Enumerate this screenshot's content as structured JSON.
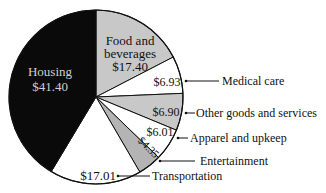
{
  "chart_data": {
    "type": "pie",
    "title": "",
    "unit": "$",
    "start_angle_deg": 0,
    "direction": "clockwise",
    "slices": [
      {
        "label": "Food and beverages",
        "value": 17.4,
        "value_label": "$17.40",
        "color": "#c8c8c8"
      },
      {
        "label": "Medical care",
        "value": 6.93,
        "value_label": "$6.93",
        "color": "#ffffff"
      },
      {
        "label": "Other goods and services",
        "value": 6.9,
        "value_label": "$6.90",
        "color": "#c8c8c8"
      },
      {
        "label": "Apparel and upkeep",
        "value": 6.01,
        "value_label": "$6.01",
        "color": "#ffffff"
      },
      {
        "label": "Entertainment",
        "value": 4.35,
        "value_label": "$4.35",
        "color": "#b4b4b4"
      },
      {
        "label": "Transportation",
        "value": 17.01,
        "value_label": "$17.01",
        "color": "#ffffff"
      },
      {
        "label": "Housing",
        "value": 41.4,
        "value_label": "$41.40",
        "color": "#0a0a0a"
      }
    ],
    "total": 100.0
  },
  "labels": {
    "housing_name": "Housing",
    "housing_value": "$41.40",
    "food_line1": "Food and",
    "food_line2": "beverages",
    "food_value": "$17.40",
    "medical_value": "$6.93",
    "medical_name": "Medical care",
    "other_value": "$6.90",
    "other_name": "Other goods and services",
    "apparel_value": "$6.01",
    "apparel_name": "Apparel and upkeep",
    "entertainment_value": "$4.35",
    "entertainment_name": "Entertainment",
    "transportation_value": "$17.01",
    "transportation_name": "Transportation"
  }
}
